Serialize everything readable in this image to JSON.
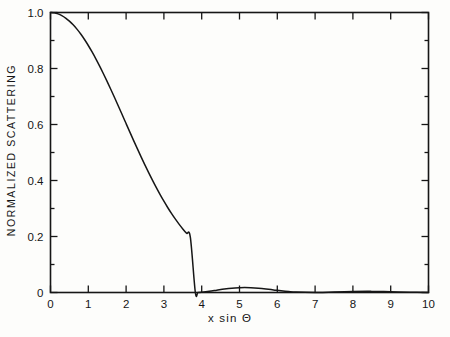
{
  "figure": {
    "ylabel": "NORMALIZED   SCATTERING",
    "xlabel": "x sin Θ",
    "background_color": "#fdfdfb",
    "line_color": "#161616",
    "axis_color": "#161616"
  },
  "axis": {
    "x_tick_labels": [
      "0",
      "1",
      "2",
      "3",
      "4",
      "5",
      "6",
      "7",
      "8",
      "9",
      "10"
    ],
    "y_tick_labels": [
      "0",
      "0.2",
      "0.4",
      "0.6",
      "0.8",
      "1.0"
    ]
  },
  "chart_data": {
    "type": "line",
    "title": "",
    "xlabel": "x sin Θ",
    "ylabel": "NORMALIZED SCATTERING",
    "xlim": [
      0,
      10
    ],
    "ylim": [
      0,
      1.0
    ],
    "xticks": [
      0,
      1,
      2,
      3,
      4,
      5,
      6,
      7,
      8,
      9,
      10
    ],
    "yticks": [
      0,
      0.2,
      0.4,
      0.6,
      0.8,
      1.0
    ],
    "x_minor_tick_interval": 1,
    "y_minor_tick_interval": 0.1,
    "grid": false,
    "legend": false,
    "frame": "box",
    "tick_direction": "in",
    "series": [
      {
        "name": "Airy diffraction intensity",
        "formula": "[2*J1(u)/u]^2 with u = pi*x*sin(theta)/3.8317*3.8317",
        "x": [
          0.0,
          0.1,
          0.2,
          0.3,
          0.4,
          0.5,
          0.6,
          0.7,
          0.8,
          0.9,
          1.0,
          1.1,
          1.2,
          1.3,
          1.4,
          1.5,
          1.6,
          1.7,
          1.8,
          1.9,
          2.0,
          2.1,
          2.2,
          2.3,
          2.4,
          2.5,
          2.6,
          2.7,
          2.8,
          2.9,
          3.0,
          3.1,
          3.2,
          3.3,
          3.4,
          3.5,
          3.6,
          3.7,
          3.8317,
          3.9,
          4.0,
          4.2,
          4.4,
          4.6,
          4.8,
          5.0,
          5.136,
          5.3,
          5.5,
          5.7,
          5.9,
          6.1,
          6.3,
          6.5,
          7.0,
          7.016,
          7.2,
          7.5,
          8.0,
          8.417,
          8.5,
          9.0,
          9.5,
          10.0
        ],
        "y": [
          1.0,
          0.99875,
          0.99501,
          0.98882,
          0.98021,
          0.96924,
          0.95598,
          0.94053,
          0.92299,
          0.90348,
          0.88213,
          0.85908,
          0.8345,
          0.80854,
          0.78137,
          0.75318,
          0.72415,
          0.69446,
          0.6643,
          0.63386,
          0.60332,
          0.57285,
          0.54262,
          0.51279,
          0.4835,
          0.45489,
          0.42709,
          0.4002,
          0.37433,
          0.34956,
          0.32596,
          0.30359,
          0.28249,
          0.2627,
          0.24423,
          0.2271,
          0.2113,
          0.19682,
          0.0,
          0.00028,
          0.00106,
          0.00415,
          0.00832,
          0.0124,
          0.01542,
          0.01694,
          0.0175,
          0.017,
          0.0152,
          0.0125,
          0.0093,
          0.0061,
          0.0034,
          0.0015,
          0.0001,
          0.0,
          0.0004,
          0.0014,
          0.0035,
          0.00416,
          0.004,
          0.0026,
          0.0009,
          0.0
        ]
      }
    ],
    "annotations": [
      {
        "text": "first zero",
        "x": 3.8317,
        "y": 0.0
      },
      {
        "text": "secondary maximum",
        "x": 5.136,
        "y": 0.0175
      }
    ]
  }
}
